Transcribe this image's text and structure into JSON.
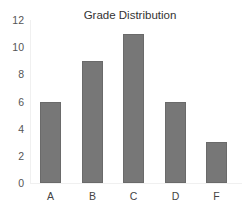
{
  "chart_data": {
    "type": "bar",
    "title": "Grade Distribution",
    "categories": [
      "A",
      "B",
      "C",
      "D",
      "F"
    ],
    "values": [
      6,
      9,
      11,
      6,
      3
    ],
    "xlabel": "",
    "ylabel": "",
    "ylim": [
      0,
      12
    ],
    "yticks": [
      0,
      2,
      4,
      6,
      8,
      10,
      12
    ],
    "grid": false,
    "legend": null,
    "bar_color": "#777777"
  }
}
